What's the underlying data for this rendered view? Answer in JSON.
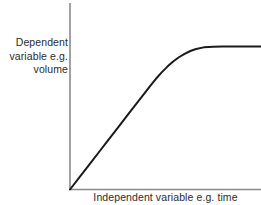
{
  "chart_data": {
    "type": "line",
    "title": "",
    "subtitle": "",
    "xlabel": "Independent variable e.g. time",
    "ylabel_lines": [
      "Dependent",
      "variable e.g.",
      "volume"
    ],
    "ylabel": "Dependent variable e.g. volume",
    "grid": false,
    "legend": null,
    "legend_position": "none",
    "axis_ticks": false,
    "tick_labels_x": [],
    "tick_labels_y": [],
    "xlim": [
      0,
      100
    ],
    "ylim": [
      0,
      100
    ],
    "annotations": [],
    "series": [
      {
        "name": "saturation curve",
        "color": "#1a1a1a",
        "width": 2,
        "x": [
          0,
          5,
          10,
          15,
          20,
          25,
          30,
          35,
          40,
          42,
          45,
          48,
          51,
          54,
          57,
          60,
          63,
          66,
          70,
          75,
          80,
          85,
          90,
          95,
          100
        ],
        "y": [
          0,
          7.5,
          15,
          22.5,
          30,
          37.5,
          45,
          52.5,
          60,
          63,
          67.3,
          71.2,
          74.7,
          77.8,
          80.4,
          82.5,
          84.2,
          85.4,
          86.4,
          86.8,
          87,
          87,
          87,
          87,
          87
        ]
      }
    ]
  },
  "axes": {
    "axis_color": "#8a8a8a",
    "axis_width": 1.6,
    "origin_px": {
      "x": 70,
      "y": 189.5
    },
    "y_axis_top_px": 3,
    "x_axis_right_px": 261
  },
  "colors": {
    "background": "#ffffff",
    "curve": "#1a1a1a",
    "axis": "#8a8a8a",
    "text": "#2b2b2b"
  }
}
